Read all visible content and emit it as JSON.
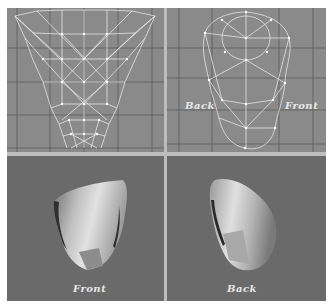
{
  "figure": {
    "panels": [
      {
        "id": "top-left",
        "view": "wireframe-side",
        "labels": []
      },
      {
        "id": "top-right",
        "view": "wireframe-top",
        "labels": [
          "Back",
          "Front"
        ]
      },
      {
        "id": "bottom-left",
        "view": "shaded-render",
        "labels": [
          "Front"
        ]
      },
      {
        "id": "bottom-right",
        "view": "shaded-render",
        "labels": [
          "Back"
        ]
      }
    ],
    "labels": {
      "top_right_left": "Back",
      "top_right_right": "Front",
      "bottom_left": "Front",
      "bottom_right": "Back"
    },
    "colors": {
      "wireframe_bg": "#8a8a8a",
      "render_bg": "#6a6a6a",
      "grid_line": "#5a5a5a",
      "wire": "#f2f2f2",
      "divider": "#bdbdbd"
    }
  }
}
